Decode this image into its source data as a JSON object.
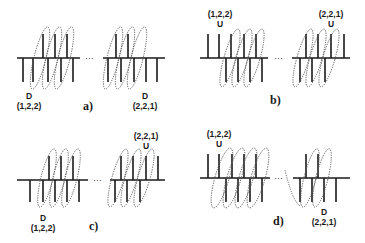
{
  "figure": {
    "panels": [
      {
        "id": "a",
        "label": "a)",
        "left_marker": {
          "letter": "D",
          "coords": "(1,2,2)",
          "position": "below"
        },
        "right_marker": {
          "letter": "D",
          "coords": "(2,2,1)",
          "position": "below"
        },
        "ellipsis": "···"
      },
      {
        "id": "b",
        "label": "b)",
        "left_marker": {
          "letter": "U",
          "coords": "(1,2,2)",
          "position": "above"
        },
        "right_marker": {
          "letter": "U",
          "coords": "(2,2,1)",
          "position": "above"
        },
        "ellipsis": "···"
      },
      {
        "id": "c",
        "label": "c)",
        "left_marker": {
          "letter": "D",
          "coords": "(1,2,2)",
          "position": "below"
        },
        "right_marker": {
          "letter": "U",
          "coords": "(2,2,1)",
          "position": "above"
        },
        "ellipsis": "···"
      },
      {
        "id": "d",
        "label": "d)",
        "left_marker": {
          "letter": "U",
          "coords": "(1,2,2)",
          "position": "above"
        },
        "right_marker": {
          "letter": "D",
          "coords": "(2,2,1)",
          "position": "below"
        },
        "ellipsis": "···"
      }
    ],
    "colors": {
      "line": "#1a1a1a",
      "loop": "#555555",
      "background": "#ffffff"
    }
  }
}
